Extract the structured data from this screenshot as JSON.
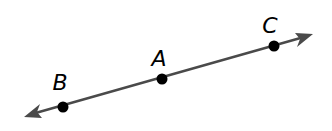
{
  "diagram": {
    "type": "geometry-line",
    "line": {
      "arrows": "both-ends",
      "color": "#4a4a4a"
    },
    "points": [
      {
        "id": "B",
        "label": "B",
        "order": 1
      },
      {
        "id": "A",
        "label": "A",
        "order": 2
      },
      {
        "id": "C",
        "label": "C",
        "order": 3
      }
    ],
    "point_color": "#000000"
  }
}
